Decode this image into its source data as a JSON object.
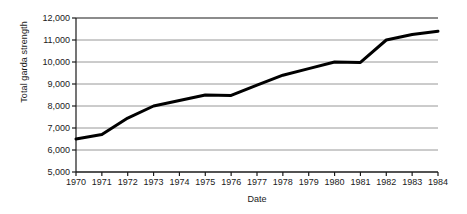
{
  "chart_data": {
    "type": "line",
    "title": "",
    "xlabel": "Date",
    "ylabel": "Total garda strength",
    "grid": "horizontal",
    "legend": "none",
    "xlim": [
      1970,
      1984
    ],
    "ylim": [
      5000,
      12000
    ],
    "ytick_step": 1000,
    "x": [
      1970,
      1971,
      1972,
      1973,
      1974,
      1975,
      1976,
      1977,
      1978,
      1979,
      1980,
      1981,
      1982,
      1983,
      1984
    ],
    "categories": [
      "1970",
      "1971",
      "1972",
      "1973",
      "1974",
      "1975",
      "1976",
      "1977",
      "1978",
      "1979",
      "1980",
      "1981",
      "1982",
      "1983",
      "1984"
    ],
    "values": [
      6500,
      6700,
      7450,
      8000,
      8250,
      8500,
      8480,
      8950,
      9400,
      9700,
      10000,
      9980,
      11000,
      11250,
      11400
    ],
    "series": [
      {
        "name": "Total garda strength",
        "color": "#000000",
        "values": [
          6500,
          6700,
          7450,
          8000,
          8250,
          8500,
          8480,
          8950,
          9400,
          9700,
          10000,
          9980,
          11000,
          11250,
          11400
        ]
      }
    ],
    "ytick_labels": [
      "12,000",
      "11,000",
      "10,000",
      "9,000",
      "8,000",
      "7,000",
      "6,000",
      "5,000"
    ],
    "ytick_values": [
      12000,
      11000,
      10000,
      9000,
      8000,
      7000,
      6000,
      5000
    ],
    "xtick_labels": [
      "1970",
      "1971",
      "1972",
      "1973",
      "1974",
      "1975",
      "1976",
      "1977",
      "1978",
      "1979",
      "1980",
      "1981",
      "1982",
      "1983",
      "1984"
    ]
  },
  "colors": {
    "line": "#000000",
    "grid": "#8c8c8c",
    "axis": "#1a1a1a",
    "background": "#ffffff",
    "text": "#1a1a1a"
  },
  "axes": {
    "y_title": "Total garda strength",
    "x_title": "Date"
  }
}
